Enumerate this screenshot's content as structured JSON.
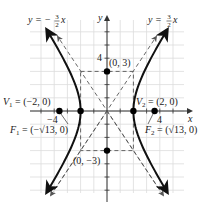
{
  "figure": {
    "type": "hyperbola-graph",
    "equation_implied": "x^2/4 - y^2/9 = 1",
    "axes": {
      "x_label": "x",
      "y_label": "y",
      "x_tick_label": "4",
      "x_neg_tick_label": "−4",
      "y_tick_label": "4",
      "unit_px": 13.2,
      "origin_px": [
        107,
        111
      ]
    },
    "asymptotes": [
      {
        "id": "neg",
        "label_prefix": "y = −",
        "num": "3",
        "den": "2",
        "var": "x",
        "slope": -1.5
      },
      {
        "id": "pos",
        "label_prefix": "y = ",
        "num": "3",
        "den": "2",
        "var": "x",
        "slope": 1.5
      }
    ],
    "rectangle": {
      "x_min": -2,
      "x_max": 2,
      "y_min": -3,
      "y_max": 3
    },
    "points": [
      {
        "id": "v1",
        "x": -2,
        "y": 0,
        "label": "V₁ = (−2, 0)"
      },
      {
        "id": "v2",
        "x": 2,
        "y": 0,
        "label": "V₂ = (2, 0)"
      },
      {
        "id": "f1",
        "x": -3.606,
        "y": 0,
        "label": "F₁ = (−√13, 0)"
      },
      {
        "id": "f2",
        "x": 3.606,
        "y": 0,
        "label": "F₂ = (√13, 0)"
      },
      {
        "id": "b_top",
        "x": 0,
        "y": 3,
        "label": "(0, 3)"
      },
      {
        "id": "b_bot",
        "x": 0,
        "y": -3,
        "label": "(0, −3)"
      }
    ],
    "colors": {
      "curve": "#111111",
      "asymptote": "#555555",
      "grid": "#dcdcdc",
      "axis": "#333333",
      "point": "#000000"
    }
  },
  "labels": {
    "asym_left_prefix": "y = −",
    "asym_left_num": "3",
    "asym_left_den": "2",
    "asym_left_var": "x",
    "asym_right_prefix": "y = ",
    "asym_right_num": "3",
    "asym_right_den": "2",
    "asym_right_var": "x",
    "y_axis": "y",
    "x_axis": "x",
    "y_tick_4": "4",
    "x_tick_4": "4",
    "x_tick_neg4": "−4",
    "b_top": "(0, 3)",
    "b_bot": "(0, −3)",
    "v1_name": "V",
    "v1_sub": "1",
    "v1_val": " = (−2, 0)",
    "v2_name": "V",
    "v2_sub": "2",
    "v2_val": " = (2, 0)",
    "f1_name": "F",
    "f1_sub": "1",
    "f1_val": " = (−√13, 0)",
    "f2_name": "F",
    "f2_sub": "2",
    "f2_val": " = (√13, 0)"
  }
}
